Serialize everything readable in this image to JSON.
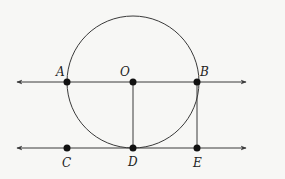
{
  "diagram": {
    "colors": {
      "stroke": "#3a3a3a",
      "point": "#111111",
      "background": "#f7f7f5"
    },
    "circle": {
      "center": "O",
      "cx": 133,
      "cy": 82,
      "r": 66
    },
    "lines": [
      {
        "name": "line-AB",
        "y": 82,
        "x1": 17,
        "x2": 246,
        "arrows": "both"
      },
      {
        "name": "line-CE",
        "y": 148,
        "x1": 17,
        "x2": 246,
        "arrows": "both"
      }
    ],
    "segments": [
      {
        "name": "segment-OD",
        "from": "O",
        "to": "D"
      },
      {
        "name": "segment-BE",
        "from": "B",
        "to": "E"
      }
    ],
    "points": [
      {
        "label": "A",
        "x": 67,
        "y": 82,
        "lx": 56,
        "ly": 75
      },
      {
        "label": "O",
        "x": 133,
        "y": 82,
        "lx": 120,
        "ly": 75
      },
      {
        "label": "B",
        "x": 197,
        "y": 82,
        "lx": 200,
        "ly": 75
      },
      {
        "label": "C",
        "x": 67,
        "y": 148,
        "lx": 62,
        "ly": 166
      },
      {
        "label": "D",
        "x": 133,
        "y": 148,
        "lx": 128,
        "ly": 166
      },
      {
        "label": "E",
        "x": 197,
        "y": 148,
        "lx": 192,
        "ly": 166
      }
    ]
  }
}
